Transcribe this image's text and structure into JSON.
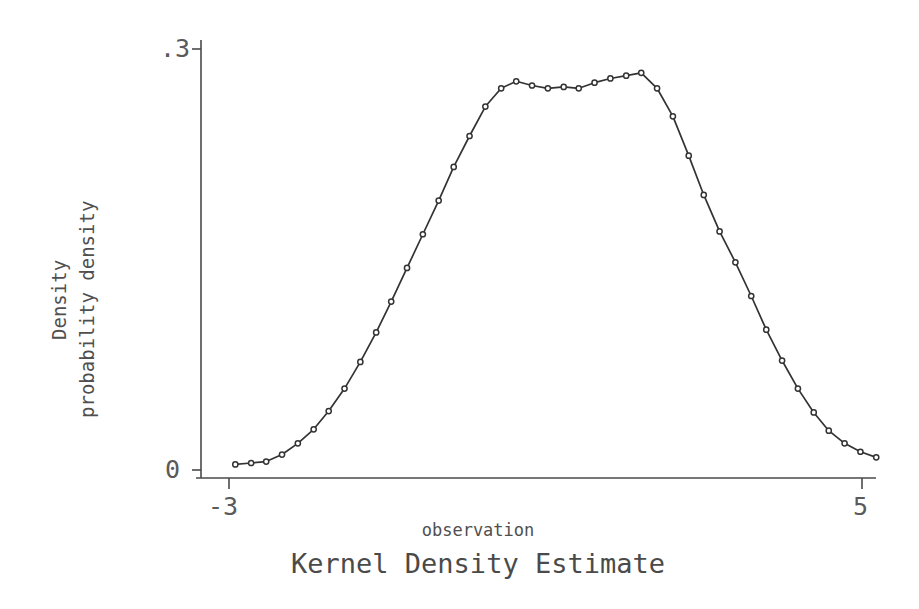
{
  "chart_data": {
    "type": "line",
    "title": "Kernel Density Estimate",
    "xlabel": "observation",
    "ylabel": "Density",
    "ylabel_secondary": "probability density",
    "xlim": [
      -3.2,
      5.2
    ],
    "ylim": [
      0,
      0.3
    ],
    "xticks": [
      -3,
      5
    ],
    "xtick_labels": [
      "-3",
      "5"
    ],
    "yticks": [
      0,
      0.3
    ],
    "ytick_labels": [
      "0",
      ".3"
    ],
    "grid": false,
    "legend": null,
    "marker": "open-circle",
    "line_color": "#333333",
    "series": [
      {
        "name": "probability density",
        "x": [
          -2.92,
          -2.72,
          -2.53,
          -2.33,
          -2.13,
          -1.93,
          -1.74,
          -1.54,
          -1.34,
          -1.14,
          -0.95,
          -0.75,
          -0.55,
          -0.35,
          -0.16,
          0.04,
          0.24,
          0.44,
          0.63,
          0.83,
          1.03,
          1.23,
          1.42,
          1.62,
          1.82,
          2.02,
          2.21,
          2.41,
          2.61,
          2.81,
          3.0,
          3.2,
          3.4,
          3.6,
          3.79,
          3.99,
          4.19,
          4.39,
          4.58,
          4.78,
          4.98,
          5.18
        ],
        "y": [
          0.004,
          0.005,
          0.006,
          0.011,
          0.019,
          0.029,
          0.042,
          0.058,
          0.077,
          0.098,
          0.12,
          0.144,
          0.168,
          0.192,
          0.216,
          0.238,
          0.259,
          0.272,
          0.277,
          0.274,
          0.272,
          0.273,
          0.272,
          0.276,
          0.279,
          0.281,
          0.283,
          0.272,
          0.252,
          0.224,
          0.196,
          0.17,
          0.148,
          0.124,
          0.1,
          0.078,
          0.058,
          0.041,
          0.028,
          0.019,
          0.013,
          0.009
        ]
      }
    ]
  },
  "labels": {
    "y_tick_top": ".3",
    "y_tick_bottom": "0",
    "x_tick_left": "-3",
    "x_tick_right": "5",
    "y_axis_outer": "Density",
    "y_axis_inner": "probability density",
    "x_axis_title": "observation",
    "figure_title": "Kernel Density Estimate"
  },
  "colors": {
    "background": "#ffffff",
    "axis": "#4a4a4a",
    "line": "#333333",
    "text": "#4f4f4f",
    "marker_face": "#ffffff"
  }
}
